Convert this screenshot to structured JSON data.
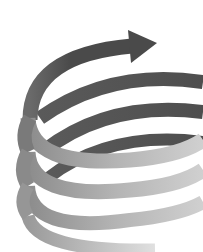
{
  "image": {
    "subject": "spiral-arrow",
    "description": "Grayscale coiled spiral ribbon with an arrowhead pointing right at the top",
    "width": 203,
    "height": 252,
    "background": "#ffffff",
    "colors": {
      "front_dark": "#4a4a4a",
      "front_mid": "#7a7a7a",
      "back_dark": "#555555",
      "light": "#c8c8c8",
      "lightest": "#dcdcdc"
    },
    "coils": 4,
    "arrow_direction": "right"
  }
}
